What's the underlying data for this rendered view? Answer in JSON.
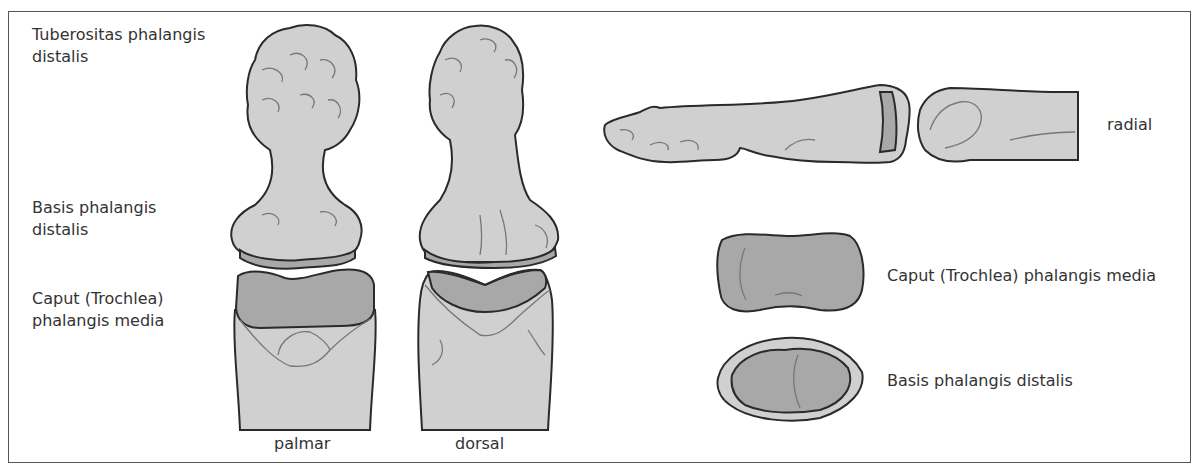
{
  "figure": {
    "left_labels": [
      {
        "line1": "Tuberositas phalangis",
        "line2": "distalis"
      },
      {
        "line1": "Basis phalangis",
        "line2": "distalis"
      },
      {
        "line1": "Caput (Trochlea)",
        "line2": "phalangis media"
      }
    ],
    "view_labels": {
      "palmar": "palmar",
      "dorsal": "dorsal",
      "radial": "radial"
    },
    "right_labels": {
      "caput": "Caput (Trochlea) phalangis media",
      "basis": "Basis phalangis distalis"
    },
    "colors": {
      "bone_fill": "#d0d0d0",
      "articular_fill": "#a8a8a8",
      "outline": "#2a2a2a",
      "detail_line": "#777777",
      "text": "#333333",
      "frame": "#555555"
    }
  }
}
